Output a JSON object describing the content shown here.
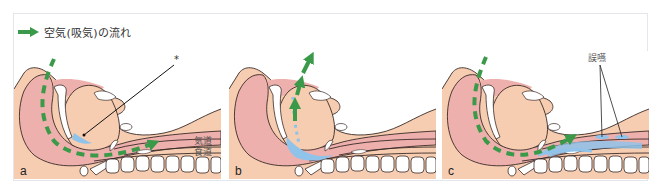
{
  "legend": {
    "icon": "green-arrow-icon",
    "text": "空気(吸気)の流れ"
  },
  "colors": {
    "skin": "#f6cdb0",
    "pharynx_pink": "#eeb0ac",
    "airflow_green": "#3a9a4a",
    "fluid_blue": "#8fc3ea",
    "outline": "#3a2a28",
    "bone_white": "#ffffff",
    "frame_border": "#e3e6ea"
  },
  "panels": [
    {
      "id": "a",
      "label": "a",
      "annotations": {
        "asterisk": "*",
        "airway": "気道",
        "esophagus": "食道"
      }
    },
    {
      "id": "b",
      "label": "b"
    },
    {
      "id": "c",
      "label": "c",
      "annotations": {
        "aspiration": "誤嚥"
      }
    }
  ]
}
